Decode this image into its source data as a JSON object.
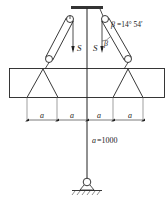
{
  "diagram": {
    "labels": {
      "force_left": "S",
      "force_right": "S",
      "angle_symbol": "β",
      "angle_annotation_symbol": "β",
      "angle_annotation_value": "=14° 54′",
      "dim_segments": [
        "a",
        "a",
        "a",
        "a"
      ],
      "dim_value_symbol": "a",
      "dim_value_text": "=1000"
    },
    "colors": {
      "line": "#222222",
      "light_line": "#666666",
      "background": "#ffffff"
    }
  }
}
